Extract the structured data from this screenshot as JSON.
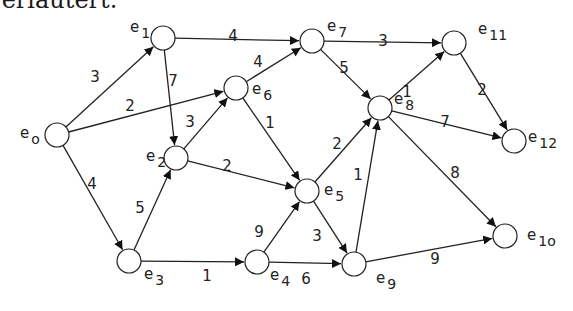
{
  "caption": "⁠ erläutert.",
  "graph": {
    "nodes": [
      {
        "id": "e0",
        "base": "e",
        "sub": "o",
        "x": 57,
        "y": 135,
        "lx": 20,
        "ly": 138
      },
      {
        "id": "e1",
        "base": "e",
        "sub": "1",
        "x": 163,
        "y": 38,
        "lx": 130,
        "ly": 32
      },
      {
        "id": "e2",
        "base": "e",
        "sub": "2",
        "x": 176,
        "y": 158,
        "lx": 146,
        "ly": 161
      },
      {
        "id": "e3",
        "base": "e",
        "sub": "3",
        "x": 129,
        "y": 261,
        "lx": 144,
        "ly": 279
      },
      {
        "id": "e4",
        "base": "e",
        "sub": "4",
        "x": 257,
        "y": 262,
        "lx": 270,
        "ly": 280
      },
      {
        "id": "e5",
        "base": "e",
        "sub": "5",
        "x": 307,
        "y": 191,
        "lx": 324,
        "ly": 195
      },
      {
        "id": "e6",
        "base": "e",
        "sub": "6",
        "x": 236,
        "y": 88,
        "lx": 252,
        "ly": 94
      },
      {
        "id": "e7",
        "base": "e",
        "sub": "7",
        "x": 312,
        "y": 41,
        "lx": 327,
        "ly": 31
      },
      {
        "id": "e8",
        "base": "e",
        "sub": "8",
        "x": 380,
        "y": 108,
        "lx": 394,
        "ly": 104
      },
      {
        "id": "e9",
        "base": "e",
        "sub": "9",
        "x": 354,
        "y": 264,
        "lx": 376,
        "ly": 283
      },
      {
        "id": "e10",
        "base": "e",
        "sub": "1o",
        "x": 505,
        "y": 236,
        "lx": 527,
        "ly": 240
      },
      {
        "id": "e11",
        "base": "e",
        "sub": "11",
        "x": 454,
        "y": 43,
        "lx": 478,
        "ly": 34
      },
      {
        "id": "e12",
        "base": "e",
        "sub": "12",
        "x": 514,
        "y": 141,
        "lx": 528,
        "ly": 142
      }
    ],
    "edges": [
      {
        "from": "e0",
        "to": "e1",
        "weight": "3",
        "lx": 95,
        "ly": 82
      },
      {
        "from": "e0",
        "to": "e6",
        "weight": "2",
        "lx": 130,
        "ly": 111
      },
      {
        "from": "e0",
        "to": "e3",
        "weight": "4",
        "lx": 92,
        "ly": 189
      },
      {
        "from": "e1",
        "to": "e7",
        "weight": "4",
        "lx": 233,
        "ly": 41
      },
      {
        "from": "e1",
        "to": "e2",
        "weight": "7",
        "lx": 173,
        "ly": 86
      },
      {
        "from": "e2",
        "to": "e6",
        "weight": "3",
        "lx": 190,
        "ly": 127
      },
      {
        "from": "e2",
        "to": "e5",
        "weight": "2",
        "lx": 227,
        "ly": 171
      },
      {
        "from": "e3",
        "to": "e2",
        "weight": "5",
        "lx": 140,
        "ly": 213
      },
      {
        "from": "e3",
        "to": "e4",
        "weight": "1",
        "lx": 207,
        "ly": 281
      },
      {
        "from": "e4",
        "to": "e5",
        "weight": "9",
        "lx": 259,
        "ly": 237
      },
      {
        "from": "e4",
        "to": "e9",
        "weight": "6",
        "lx": 306,
        "ly": 284
      },
      {
        "from": "e5",
        "to": "e8",
        "weight": "2",
        "lx": 337,
        "ly": 149
      },
      {
        "from": "e5",
        "to": "e9",
        "weight": "3",
        "lx": 317,
        "ly": 241
      },
      {
        "from": "e6",
        "to": "e7",
        "weight": "4",
        "lx": 258,
        "ly": 67
      },
      {
        "from": "e6",
        "to": "e5",
        "weight": "1",
        "lx": 270,
        "ly": 128
      },
      {
        "from": "e7",
        "to": "e11",
        "weight": "3",
        "lx": 383,
        "ly": 46
      },
      {
        "from": "e7",
        "to": "e8",
        "weight": "5",
        "lx": 344,
        "ly": 73
      },
      {
        "from": "e8",
        "to": "e11",
        "weight": "1",
        "lx": 407,
        "ly": 97
      },
      {
        "from": "e8",
        "to": "e12",
        "weight": "7",
        "lx": 445,
        "ly": 127
      },
      {
        "from": "e8",
        "to": "e10",
        "weight": "8",
        "lx": 455,
        "ly": 178
      },
      {
        "from": "e9",
        "to": "e8",
        "weight": "1",
        "lx": 358,
        "ly": 180
      },
      {
        "from": "e9",
        "to": "e10",
        "weight": "9",
        "lx": 435,
        "ly": 264
      },
      {
        "from": "e11",
        "to": "e12",
        "weight": "2",
        "lx": 482,
        "ly": 95
      }
    ]
  }
}
